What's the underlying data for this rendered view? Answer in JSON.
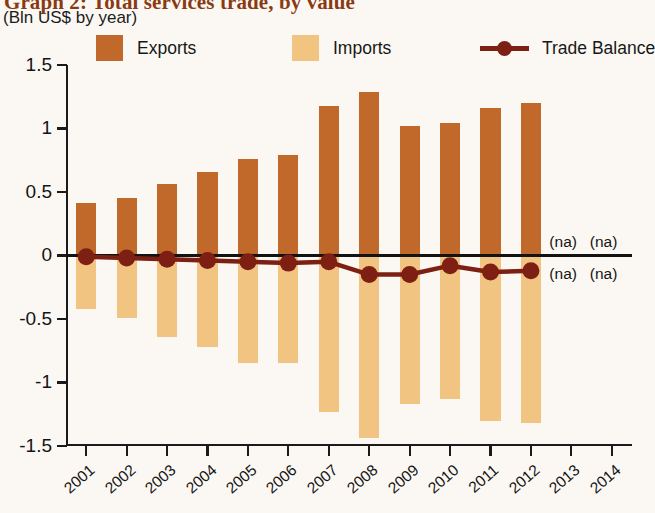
{
  "header": {
    "title": "Graph 2: Total services trade, by value",
    "subtitle": "(Bln US$ by year)"
  },
  "legend": {
    "position": "top",
    "items": [
      {
        "label": "Exports",
        "color": "#c1692b",
        "marker": "square"
      },
      {
        "label": "Imports",
        "color": "#f2c482",
        "marker": "square"
      },
      {
        "label": "Trade Balance",
        "color": "#7e1f14",
        "marker": "line-dot"
      }
    ]
  },
  "annotations": {
    "na_upper_2013": "(na)",
    "na_upper_2014": "(na)",
    "na_lower_2013": "(na)",
    "na_lower_2014": "(na)"
  },
  "colors": {
    "exports": "#c1692b",
    "imports": "#f2c482",
    "balance": "#7e1f14",
    "axis": "#1a1a1a",
    "background": "#fbf8f3",
    "title": "#8a3a12"
  },
  "chart_data": {
    "type": "bar",
    "title": "Graph 2: Total services trade, by value",
    "subtitle": "(Bln US$ by year)",
    "xlabel": "",
    "ylabel": "Bln US$",
    "ylim": [
      -1.5,
      1.5
    ],
    "yticks": [
      1.5,
      1,
      0.5,
      0,
      -0.5,
      -1,
      -1.5
    ],
    "ytick_labels": [
      "1.5",
      "1",
      "0.5",
      "0",
      "-0.5",
      "-1",
      "-1.5"
    ],
    "grid": false,
    "legend_position": "top",
    "categories": [
      "2001",
      "2002",
      "2003",
      "2004",
      "2005",
      "2006",
      "2007",
      "2008",
      "2009",
      "2010",
      "2011",
      "2012",
      "2013",
      "2014"
    ],
    "series": [
      {
        "name": "Exports",
        "type": "bar",
        "color": "#c1692b",
        "values": [
          0.41,
          0.45,
          0.56,
          0.66,
          0.76,
          0.79,
          1.18,
          1.29,
          1.02,
          1.04,
          1.16,
          1.2,
          null,
          null
        ]
      },
      {
        "name": "Imports",
        "type": "bar",
        "color": "#f2c482",
        "values": [
          -0.42,
          -0.49,
          -0.64,
          -0.72,
          -0.85,
          -0.85,
          -1.23,
          -1.44,
          -1.17,
          -1.13,
          -1.3,
          -1.32,
          null,
          null
        ]
      },
      {
        "name": "Trade Balance",
        "type": "line",
        "color": "#7e1f14",
        "values": [
          -0.01,
          -0.02,
          -0.03,
          -0.04,
          -0.05,
          -0.06,
          -0.05,
          -0.15,
          -0.15,
          -0.08,
          -0.13,
          -0.12,
          null,
          null
        ]
      }
    ],
    "missing_data_note": "(na)",
    "missing_data_years": [
      "2013",
      "2014"
    ]
  }
}
